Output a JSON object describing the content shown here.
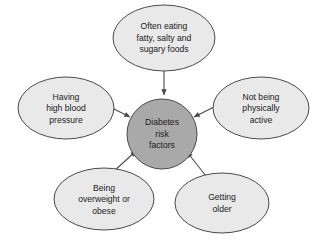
{
  "diagram": {
    "title": "Diabetes risk factors",
    "background_color": "#ffffff",
    "center_fill": "#a9a9a9",
    "node_fill": "#e9e9e9",
    "stroke_color": "#4a4a4a",
    "text_color": "#1a1a1a",
    "center": {
      "label": "Diabetes risk factors",
      "lines": [
        "Diabetes",
        "risk",
        "factors"
      ]
    },
    "factors": [
      {
        "id": "diet",
        "label": "Often eating fatty, salty and sugary foods",
        "lines": [
          "Often eating",
          "fatty, salty and",
          "sugary foods"
        ],
        "position": "top"
      },
      {
        "id": "blood-pressure",
        "label": "Having high blood pressure",
        "lines": [
          "Having",
          "high blood",
          "pressure"
        ],
        "position": "left"
      },
      {
        "id": "inactivity",
        "label": "Not being physically active",
        "lines": [
          "Not being",
          "physically",
          "active"
        ],
        "position": "right"
      },
      {
        "id": "overweight",
        "label": "Being overweight or obese",
        "lines": [
          "Being",
          "overweight or",
          "obese"
        ],
        "position": "bottom-left"
      },
      {
        "id": "age",
        "label": "Getting older",
        "lines": [
          "Getting",
          "older"
        ],
        "position": "bottom-right"
      }
    ]
  }
}
